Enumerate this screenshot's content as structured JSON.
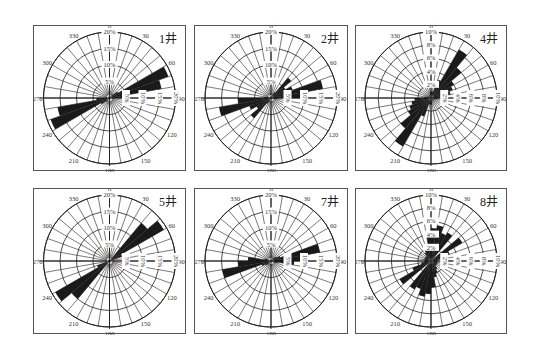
{
  "chart_data": [
    {
      "type": "rose",
      "title": "1井",
      "bin_deg": 10,
      "bidirectional": true,
      "radial_max": 20,
      "radial_ticks": [
        "5%",
        "10%",
        "15%",
        "20%"
      ],
      "angle_labels": [
        "0",
        "30",
        "60",
        "90",
        "120",
        "150",
        "180",
        "210",
        "240",
        "270",
        "300",
        "330"
      ],
      "bins": [
        {
          "from": 0,
          "to": 10,
          "value": 0.5
        },
        {
          "from": 10,
          "to": 20,
          "value": 0.5
        },
        {
          "from": 20,
          "to": 30,
          "value": 0.5
        },
        {
          "from": 30,
          "to": 40,
          "value": 1
        },
        {
          "from": 40,
          "to": 50,
          "value": 1.5
        },
        {
          "from": 50,
          "to": 60,
          "value": 3
        },
        {
          "from": 60,
          "to": 70,
          "value": 19
        },
        {
          "from": 70,
          "to": 80,
          "value": 16
        },
        {
          "from": 80,
          "to": 90,
          "value": 4
        },
        {
          "from": 90,
          "to": 100,
          "value": 1
        },
        {
          "from": 100,
          "to": 110,
          "value": 0.5
        },
        {
          "from": 110,
          "to": 120,
          "value": 0.5
        },
        {
          "from": 120,
          "to": 130,
          "value": 0.5
        },
        {
          "from": 130,
          "to": 140,
          "value": 0.5
        },
        {
          "from": 140,
          "to": 150,
          "value": 0.5
        },
        {
          "from": 150,
          "to": 160,
          "value": 0.5
        },
        {
          "from": 160,
          "to": 170,
          "value": 0.5
        },
        {
          "from": 170,
          "to": 180,
          "value": 0.5
        }
      ]
    },
    {
      "type": "rose",
      "title": "2井",
      "bin_deg": 10,
      "bidirectional": true,
      "radial_max": 20,
      "radial_ticks": [
        "5%",
        "10%",
        "15%",
        "20%"
      ],
      "angle_labels": [
        "0",
        "30",
        "60",
        "90",
        "120",
        "150",
        "180",
        "210",
        "240",
        "270",
        "300",
        "330"
      ],
      "bins": [
        {
          "from": 0,
          "to": 10,
          "value": 0.5
        },
        {
          "from": 10,
          "to": 20,
          "value": 0.5
        },
        {
          "from": 20,
          "to": 30,
          "value": 1
        },
        {
          "from": 30,
          "to": 40,
          "value": 2
        },
        {
          "from": 40,
          "to": 50,
          "value": 8
        },
        {
          "from": 50,
          "to": 60,
          "value": 5
        },
        {
          "from": 60,
          "to": 70,
          "value": 7
        },
        {
          "from": 70,
          "to": 80,
          "value": 16
        },
        {
          "from": 80,
          "to": 90,
          "value": 10
        },
        {
          "from": 90,
          "to": 100,
          "value": 2
        },
        {
          "from": 100,
          "to": 110,
          "value": 1
        },
        {
          "from": 110,
          "to": 120,
          "value": 0.5
        },
        {
          "from": 120,
          "to": 130,
          "value": 0.5
        },
        {
          "from": 130,
          "to": 140,
          "value": 0.5
        },
        {
          "from": 140,
          "to": 150,
          "value": 0.5
        },
        {
          "from": 150,
          "to": 160,
          "value": 0.5
        },
        {
          "from": 160,
          "to": 170,
          "value": 0.5
        },
        {
          "from": 170,
          "to": 180,
          "value": 0.5
        }
      ]
    },
    {
      "type": "rose",
      "title": "4井",
      "bin_deg": 10,
      "bidirectional": true,
      "radial_max": 10,
      "radial_ticks": [
        "2%",
        "4%",
        "6%",
        "8%",
        "10%"
      ],
      "angle_labels": [
        "0",
        "30",
        "60",
        "90",
        "120",
        "150",
        "180",
        "210",
        "240",
        "270",
        "300",
        "330"
      ],
      "bins": [
        {
          "from": 0,
          "to": 10,
          "value": 1
        },
        {
          "from": 10,
          "to": 20,
          "value": 1
        },
        {
          "from": 20,
          "to": 30,
          "value": 3
        },
        {
          "from": 30,
          "to": 40,
          "value": 8.5
        },
        {
          "from": 40,
          "to": 50,
          "value": 6
        },
        {
          "from": 50,
          "to": 60,
          "value": 4
        },
        {
          "from": 60,
          "to": 70,
          "value": 3.5
        },
        {
          "from": 70,
          "to": 80,
          "value": 3
        },
        {
          "from": 80,
          "to": 90,
          "value": 2.5
        },
        {
          "from": 90,
          "to": 100,
          "value": 1
        },
        {
          "from": 100,
          "to": 110,
          "value": 0.5
        },
        {
          "from": 110,
          "to": 120,
          "value": 0.5
        },
        {
          "from": 120,
          "to": 130,
          "value": 0.5
        },
        {
          "from": 130,
          "to": 140,
          "value": 0.5
        },
        {
          "from": 140,
          "to": 150,
          "value": 0.5
        },
        {
          "from": 150,
          "to": 160,
          "value": 0.5
        },
        {
          "from": 160,
          "to": 170,
          "value": 0.5
        },
        {
          "from": 170,
          "to": 180,
          "value": 1
        }
      ]
    },
    {
      "type": "rose",
      "title": "5井",
      "bin_deg": 10,
      "bidirectional": true,
      "radial_max": 20,
      "radial_ticks": [
        "5%",
        "10%",
        "15%",
        "20%"
      ],
      "angle_labels": [
        "0",
        "30",
        "60",
        "90",
        "120",
        "150",
        "180",
        "210",
        "240",
        "270",
        "300",
        "330"
      ],
      "bins": [
        {
          "from": 0,
          "to": 10,
          "value": 0.5
        },
        {
          "from": 10,
          "to": 20,
          "value": 0.5
        },
        {
          "from": 20,
          "to": 30,
          "value": 0.5
        },
        {
          "from": 30,
          "to": 40,
          "value": 1
        },
        {
          "from": 40,
          "to": 50,
          "value": 15
        },
        {
          "from": 50,
          "to": 60,
          "value": 19
        },
        {
          "from": 60,
          "to": 70,
          "value": 4
        },
        {
          "from": 70,
          "to": 80,
          "value": 1
        },
        {
          "from": 80,
          "to": 90,
          "value": 0.5
        },
        {
          "from": 90,
          "to": 100,
          "value": 0.5
        },
        {
          "from": 100,
          "to": 110,
          "value": 0.5
        },
        {
          "from": 110,
          "to": 120,
          "value": 0.5
        },
        {
          "from": 120,
          "to": 130,
          "value": 0.5
        },
        {
          "from": 130,
          "to": 140,
          "value": 0.5
        },
        {
          "from": 140,
          "to": 150,
          "value": 0.5
        },
        {
          "from": 150,
          "to": 160,
          "value": 0.5
        },
        {
          "from": 160,
          "to": 170,
          "value": 0.5
        },
        {
          "from": 170,
          "to": 180,
          "value": 0.5
        }
      ]
    },
    {
      "type": "rose",
      "title": "7井",
      "bin_deg": 10,
      "bidirectional": true,
      "radial_max": 20,
      "radial_ticks": [
        "5%",
        "10%",
        "15%",
        "20%"
      ],
      "angle_labels": [
        "0",
        "30",
        "60",
        "90",
        "120",
        "150",
        "180",
        "210",
        "240",
        "270",
        "300",
        "330"
      ],
      "bins": [
        {
          "from": 0,
          "to": 10,
          "value": 0.5
        },
        {
          "from": 10,
          "to": 20,
          "value": 0.5
        },
        {
          "from": 20,
          "to": 30,
          "value": 0.5
        },
        {
          "from": 30,
          "to": 40,
          "value": 1
        },
        {
          "from": 40,
          "to": 50,
          "value": 1.5
        },
        {
          "from": 50,
          "to": 60,
          "value": 2
        },
        {
          "from": 60,
          "to": 70,
          "value": 3
        },
        {
          "from": 70,
          "to": 80,
          "value": 15
        },
        {
          "from": 80,
          "to": 90,
          "value": 10
        },
        {
          "from": 90,
          "to": 100,
          "value": 7
        },
        {
          "from": 100,
          "to": 110,
          "value": 2
        },
        {
          "from": 110,
          "to": 120,
          "value": 1
        },
        {
          "from": 120,
          "to": 130,
          "value": 0.5
        },
        {
          "from": 130,
          "to": 140,
          "value": 0.5
        },
        {
          "from": 140,
          "to": 150,
          "value": 0.5
        },
        {
          "from": 150,
          "to": 160,
          "value": 0.5
        },
        {
          "from": 160,
          "to": 170,
          "value": 0.5
        },
        {
          "from": 170,
          "to": 180,
          "value": 0.5
        }
      ]
    },
    {
      "type": "rose",
      "title": "8井",
      "bin_deg": 10,
      "bidirectional": true,
      "radial_max": 10,
      "radial_ticks": [
        "2%",
        "4%",
        "6%",
        "8%",
        "10%"
      ],
      "angle_labels": [
        "0",
        "30",
        "60",
        "90",
        "120",
        "150",
        "180",
        "210",
        "240",
        "270",
        "300",
        "330"
      ],
      "bins": [
        {
          "from": 0,
          "to": 10,
          "value": 5
        },
        {
          "from": 10,
          "to": 20,
          "value": 5.5
        },
        {
          "from": 20,
          "to": 30,
          "value": 4.5
        },
        {
          "from": 30,
          "to": 40,
          "value": 5
        },
        {
          "from": 40,
          "to": 50,
          "value": 0.5
        },
        {
          "from": 50,
          "to": 60,
          "value": 5.5
        },
        {
          "from": 60,
          "to": 70,
          "value": 3
        },
        {
          "from": 70,
          "to": 80,
          "value": 1.5
        },
        {
          "from": 80,
          "to": 90,
          "value": 1
        },
        {
          "from": 90,
          "to": 100,
          "value": 1
        },
        {
          "from": 100,
          "to": 110,
          "value": 1
        },
        {
          "from": 110,
          "to": 120,
          "value": 1
        },
        {
          "from": 120,
          "to": 130,
          "value": 1
        },
        {
          "from": 130,
          "to": 140,
          "value": 1
        },
        {
          "from": 140,
          "to": 150,
          "value": 1.5
        },
        {
          "from": 150,
          "to": 160,
          "value": 2
        },
        {
          "from": 160,
          "to": 170,
          "value": 2.5
        },
        {
          "from": 170,
          "to": 180,
          "value": 4
        }
      ]
    }
  ]
}
